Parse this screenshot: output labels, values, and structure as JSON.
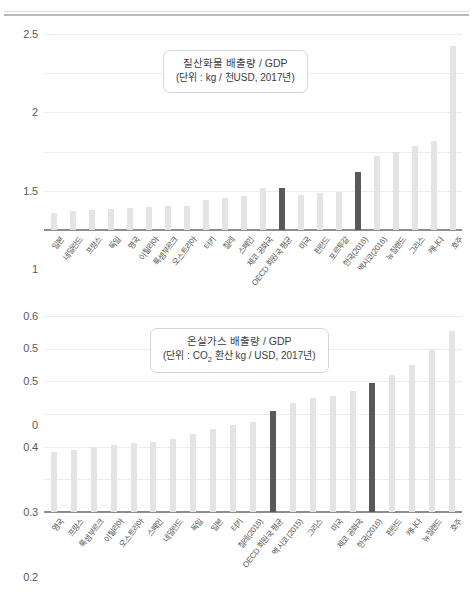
{
  "page": {
    "divider": "horizontal-rule"
  },
  "chart_data": [
    {
      "type": "bar",
      "id": "nitrogen-oxides-chart",
      "title": "질산화물 배출량 / GDP",
      "subtitle": "(단위 : kg / 천USD, 2017년)",
      "xlabel": "",
      "ylabel": "",
      "ylim": [
        0,
        2.5
      ],
      "yticks": [
        "0",
        "0.5",
        "1",
        "1.5",
        "2",
        "2.5"
      ],
      "ytick_values": [
        0,
        0.5,
        1,
        1.5,
        2,
        2.5
      ],
      "grid": true,
      "legend": "none",
      "highlight_color": "#595959",
      "bar_color": "#e4e4e4",
      "categories": [
        "일본",
        "네덜란드",
        "프랑스",
        "독일",
        "영국",
        "이탈리아",
        "룩셈부르크",
        "오스트리아",
        "터키",
        "칠레",
        "스페인",
        "체코 공화국",
        "OECD 회원국 평균",
        "미국",
        "핀란드",
        "포르투갈",
        "한국(2016)",
        "멕시코(2016)",
        "뉴질랜드",
        "그리스",
        "캐나다",
        "호주"
      ],
      "values": [
        0.22,
        0.24,
        0.26,
        0.27,
        0.28,
        0.29,
        0.3,
        0.31,
        0.38,
        0.41,
        0.44,
        0.53,
        0.53,
        0.45,
        0.47,
        0.48,
        0.74,
        0.95,
        1.0,
        1.07,
        1.13,
        2.35
      ],
      "highlighted": [
        12,
        16
      ]
    },
    {
      "type": "bar",
      "id": "greenhouse-gas-chart",
      "title": "온실가스 배출량 / GDP",
      "subtitle_prefix": "(단위 : CO",
      "subtitle_sub": "2",
      "subtitle_suffix": " 환산 kg / USD, 2017년)",
      "subtitle": "(단위 : CO2 환산 kg / USD, 2017년)",
      "xlabel": "",
      "ylabel": "",
      "ylim": [
        0,
        0.6
      ],
      "yticks": [
        "0",
        "0.1",
        "0.2",
        "0.3",
        "0.4",
        "0.5",
        "0.6"
      ],
      "ytick_values": [
        0,
        0.1,
        0.2,
        0.3,
        0.4,
        0.5,
        0.6
      ],
      "grid": true,
      "legend": "none",
      "highlight_color": "#595959",
      "bar_color": "#e4e4e4",
      "categories": [
        "영국",
        "프랑스",
        "룩셈부르크",
        "이탈리아",
        "오스트리아",
        "스페인",
        "네덜란드",
        "독일",
        "일본",
        "터키",
        "칠레(2016)",
        "OECD 회원국 평균",
        "멕시코 (2015)",
        "그리스",
        "미국",
        "체코 공화국",
        "한국(2016)",
        "핀란드",
        "캐나다",
        "뉴질랜드",
        "호주"
      ],
      "values": [
        0.185,
        0.19,
        0.2,
        0.205,
        0.21,
        0.215,
        0.225,
        0.24,
        0.255,
        0.265,
        0.275,
        0.31,
        0.335,
        0.35,
        0.355,
        0.37,
        0.395,
        0.42,
        0.45,
        0.5,
        0.555
      ],
      "highlighted": [
        11,
        16
      ]
    }
  ]
}
